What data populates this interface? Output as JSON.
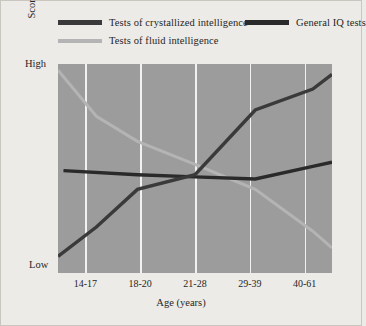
{
  "chart_data": {
    "type": "line",
    "title": "",
    "xlabel": "Age (years)",
    "ylabel": "Score",
    "categories": [
      "14-17",
      "18-20",
      "21-28",
      "29-39",
      "40-61"
    ],
    "ytick_labels": [
      "High",
      "Low"
    ],
    "ylim": [
      0,
      100
    ],
    "grid": "vertical-only",
    "legend_position": "top",
    "plot_background": "#9c9c9c",
    "gridline_color": "#f2f1ef",
    "series": [
      {
        "name": "Tests of crystallized intelligence",
        "color": "#3a3a3a",
        "width": 3.4,
        "x": [
          0,
          14,
          29,
          50,
          72,
          93,
          100
        ],
        "values": [
          8,
          22,
          40,
          47,
          78,
          88,
          95
        ]
      },
      {
        "name": "General IQ tests",
        "color": "#2a2a2a",
        "width": 3.4,
        "x": [
          2,
          29,
          50,
          72,
          93,
          100
        ],
        "values": [
          49,
          47,
          46,
          45,
          51,
          53
        ]
      },
      {
        "name": "Tests of fluid intelligence",
        "color": "#b4b4b4",
        "width": 3.0,
        "x": [
          0,
          14,
          29,
          50,
          72,
          93,
          100
        ],
        "values": [
          97,
          75,
          63,
          52,
          40,
          20,
          12
        ]
      }
    ]
  },
  "legend": {
    "entries": [
      {
        "label": "Tests of crystallized intelligence",
        "color": "#3a3a3a"
      },
      {
        "label": "General IQ tests",
        "color": "#2a2a2a"
      },
      {
        "label": "Tests of fluid intelligence",
        "color": "#b4b4b4"
      }
    ]
  },
  "axes": {
    "y_high": "High",
    "y_low": "Low",
    "y_title": "Score",
    "x_title": "Age (years)"
  }
}
